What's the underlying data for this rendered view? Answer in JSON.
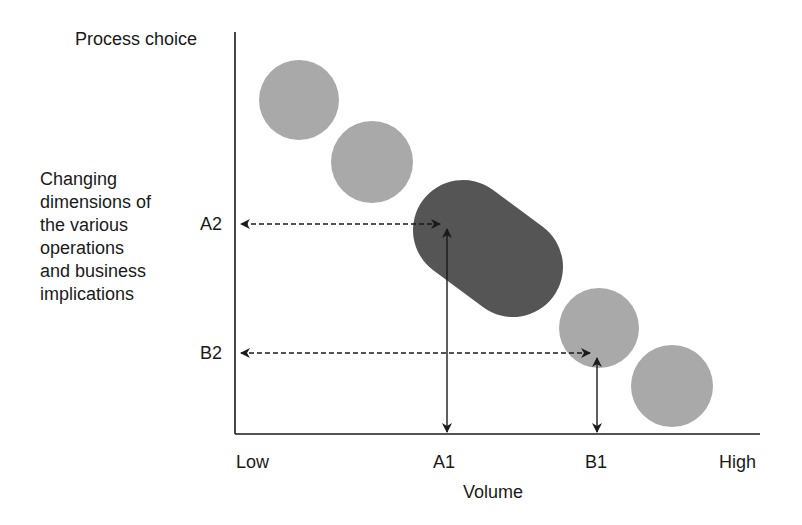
{
  "title": "Process choice",
  "y_description_lines": [
    "Changing",
    "dimensions of",
    "the various",
    "operations",
    "and business",
    "implications"
  ],
  "y_ticks": {
    "a2": "A2",
    "b2": "B2"
  },
  "x_ticks": {
    "low": "Low",
    "a1": "A1",
    "b1": "B1",
    "high": "High"
  },
  "x_axis_label": "Volume",
  "colors": {
    "light_shape": "#a9a9a9",
    "dark_shape": "#555555",
    "axis": "#1a1a1a"
  },
  "shapes": [
    {
      "type": "circle",
      "shade": "light",
      "cx": 299,
      "cy": 100,
      "r": 40
    },
    {
      "type": "circle",
      "shade": "light",
      "cx": 372,
      "cy": 162,
      "r": 40
    },
    {
      "type": "capsule",
      "shade": "dark",
      "x1": 463,
      "y1": 230,
      "x2": 513,
      "y2": 267,
      "r": 50
    },
    {
      "type": "circle",
      "shade": "light",
      "cx": 599,
      "cy": 328,
      "r": 40
    },
    {
      "type": "circle",
      "shade": "light",
      "cx": 672,
      "cy": 386,
      "r": 40
    }
  ],
  "markers": {
    "A": {
      "x_label": "A1",
      "y_label": "A2",
      "x": 447,
      "y": 224
    },
    "B": {
      "x_label": "B1",
      "y_label": "B2",
      "x": 597,
      "y": 353
    }
  }
}
